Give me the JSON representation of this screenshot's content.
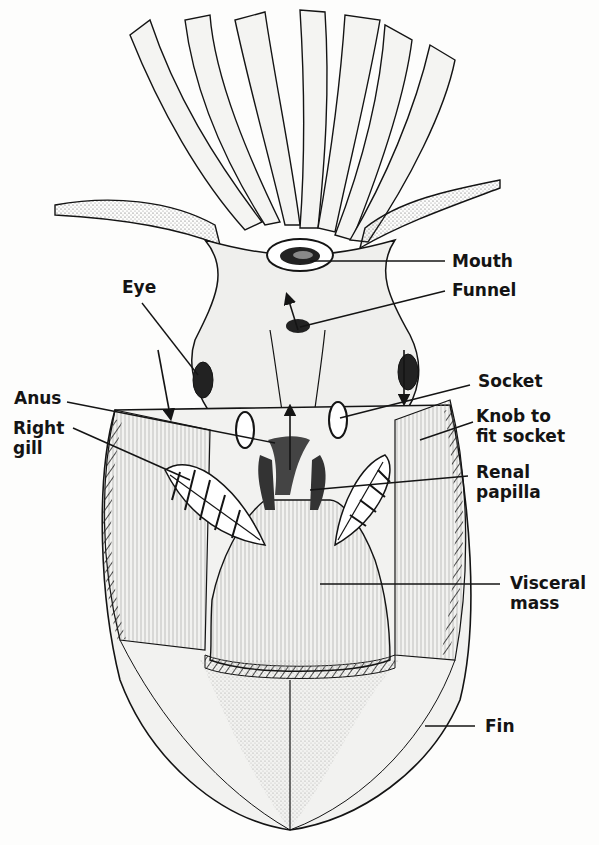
{
  "figure": {
    "labels": {
      "mouth": "Mouth",
      "funnel": "Funnel",
      "eye": "Eye",
      "socket": "Socket",
      "anus": "Anus",
      "knob_line1": "Knob to",
      "knob_line2": "fit socket",
      "right_gill_line1": "Right",
      "right_gill_line2": "gill",
      "renal_line1": "Renal",
      "renal_line2": "papilla",
      "visceral_line1": "Visceral",
      "visceral_line2": "mass",
      "fin": "Fin"
    },
    "colors": {
      "ink": "#141414",
      "paper": "#fdfdfc",
      "shade": "#9a9a9a"
    }
  }
}
